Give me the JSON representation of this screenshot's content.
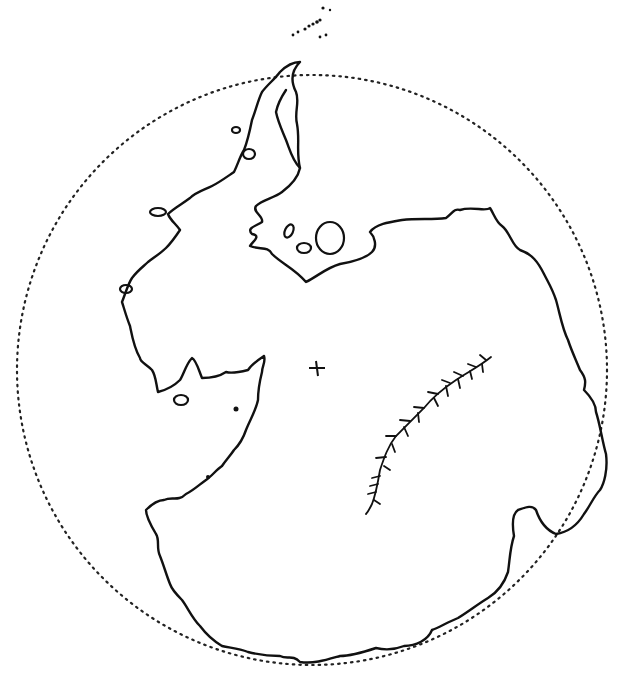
{
  "map": {
    "subject": "Antarctica coastline outline",
    "style": "black line drawing on white",
    "colors": {
      "background": "#ffffff",
      "ink": "#111111"
    },
    "features": {
      "outer_circle": {
        "style": "dotted",
        "center": [
          312,
          370
        ],
        "radius": 295
      },
      "pole_marker": {
        "glyph": "+",
        "position": [
          316,
          368
        ]
      },
      "mountain_range": {
        "style": "branched ridge line"
      },
      "peninsula": {
        "direction": "north, toward top"
      },
      "islands": {
        "count_visible_approx": 8
      }
    }
  }
}
